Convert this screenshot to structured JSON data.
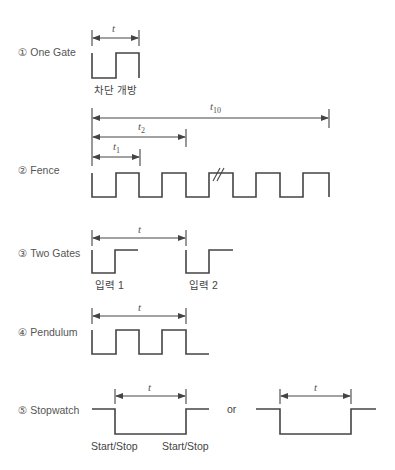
{
  "diagram": {
    "type": "timing-modes",
    "sections": [
      {
        "id": "one-gate",
        "label": "① One Gate",
        "interval_label": "t",
        "captions": [
          "차단 개방"
        ]
      },
      {
        "id": "fence",
        "label": "② Fence",
        "intervals": [
          {
            "label": "t",
            "sub": "1"
          },
          {
            "label": "t",
            "sub": "2"
          },
          {
            "label": "t",
            "sub": "10"
          }
        ],
        "break_mark": "//"
      },
      {
        "id": "two-gates",
        "label": "③ Two Gates",
        "interval_label": "t",
        "captions": [
          "입력 1",
          "입력 2"
        ]
      },
      {
        "id": "pendulum",
        "label": "④ Pendulum",
        "interval_label": "t"
      },
      {
        "id": "stopwatch",
        "label": "⑤ Stopwatch",
        "interval_label": "t",
        "interval_label_alt": "t",
        "captions": [
          "Start/Stop",
          "Start/Stop"
        ],
        "or_label": "or"
      }
    ],
    "colors": {
      "line": "#444444",
      "text": "#555555",
      "background": "#ffffff"
    }
  }
}
